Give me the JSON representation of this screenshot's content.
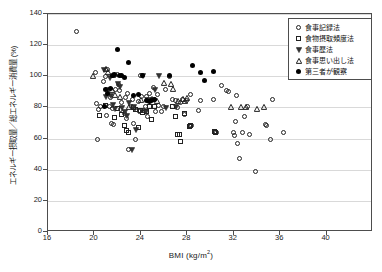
{
  "chart_data": {
    "type": "scatter",
    "title": "",
    "xlabel": "BMI (kg/m2)",
    "xlabel_base": "BMI (kg/m",
    "xlabel_sup": "2",
    "xlabel_close": ")",
    "ylabel": "エネルギー摂取量／総エネルギー消費量 (%)",
    "xlim": [
      16,
      44
    ],
    "ylim": [
      0,
      140
    ],
    "xticks": [
      16,
      20,
      24,
      28,
      32,
      36,
      40
    ],
    "yticks": [
      0,
      20,
      40,
      60,
      80,
      100,
      120,
      140
    ],
    "grid": "horizontal",
    "legend_position": "top-right",
    "series": [
      {
        "name": "食事記録法",
        "marker": "open-circle",
        "color": "#222222",
        "points": [
          [
            18.5,
            128.5
          ],
          [
            20.1,
            101.8
          ],
          [
            20.3,
            59.4
          ],
          [
            20.2,
            82.2
          ],
          [
            20.4,
            78.5
          ],
          [
            20.6,
            80.4
          ],
          [
            20.8,
            96.6
          ],
          [
            21.0,
            99.6
          ],
          [
            21.2,
            103.8
          ],
          [
            21.4,
            86.0
          ],
          [
            21.3,
            80.0
          ],
          [
            21.6,
            79.0
          ],
          [
            21.5,
            69.2
          ],
          [
            21.7,
            68.6
          ],
          [
            21.9,
            91.5
          ],
          [
            22.0,
            100.8
          ],
          [
            22.1,
            94.2
          ],
          [
            22.2,
            90.6
          ],
          [
            22.3,
            78.5
          ],
          [
            22.4,
            83.0
          ],
          [
            22.6,
            76.0
          ],
          [
            22.8,
            72.3
          ],
          [
            22.9,
            88.9
          ],
          [
            23.0,
            52.8
          ],
          [
            23.2,
            80.5
          ],
          [
            23.3,
            85.0
          ],
          [
            23.5,
            79.0
          ],
          [
            23.6,
            59.0
          ],
          [
            23.8,
            83.6
          ],
          [
            23.9,
            76.8
          ],
          [
            24.0,
            100.0
          ],
          [
            24.1,
            87.0
          ],
          [
            24.2,
            78.0
          ],
          [
            24.3,
            77.4
          ],
          [
            24.4,
            80.0
          ],
          [
            24.5,
            86.5
          ],
          [
            24.7,
            84.0
          ],
          [
            24.8,
            88.5
          ],
          [
            25.0,
            85.0
          ],
          [
            25.1,
            92.3
          ],
          [
            25.2,
            84.6
          ],
          [
            25.3,
            77.0
          ],
          [
            25.5,
            88.0
          ],
          [
            25.6,
            81.0
          ],
          [
            26.0,
            80.5
          ],
          [
            26.2,
            91.0
          ],
          [
            26.5,
            99.3
          ],
          [
            26.8,
            85.0
          ],
          [
            27.0,
            84.0
          ],
          [
            27.2,
            79.5
          ],
          [
            27.5,
            83.0
          ],
          [
            27.6,
            85.0
          ],
          [
            28.0,
            84.0
          ],
          [
            28.3,
            88.0
          ],
          [
            28.4,
            68.0
          ],
          [
            29.0,
            77.5
          ],
          [
            30.3,
            85.0
          ],
          [
            30.6,
            63.8
          ],
          [
            31.0,
            93.5
          ],
          [
            31.4,
            90.5
          ],
          [
            31.6,
            90.0
          ],
          [
            32.0,
            63.8
          ],
          [
            32.1,
            61.5
          ],
          [
            32.2,
            70.5
          ],
          [
            32.3,
            87.5
          ],
          [
            32.4,
            56.8
          ],
          [
            32.5,
            46.8
          ],
          [
            32.8,
            63.8
          ],
          [
            33.0,
            74.0
          ],
          [
            33.2,
            80.0
          ],
          [
            33.4,
            62.3
          ],
          [
            33.9,
            38.5
          ],
          [
            34.8,
            68.5
          ],
          [
            34.9,
            68.0
          ],
          [
            35.2,
            58.8
          ],
          [
            35.4,
            85.0
          ],
          [
            36.3,
            63.8
          ],
          [
            21.1,
            74.5
          ],
          [
            22.7,
            86.0
          ],
          [
            23.4,
            69.5
          ],
          [
            24.6,
            74.0
          ],
          [
            25.8,
            77.0
          ],
          [
            27.8,
            75.0
          ],
          [
            29.2,
            84.0
          ]
        ]
      },
      {
        "name": "食物摂取頻度法",
        "marker": "open-square",
        "color": "#222222",
        "points": [
          [
            20.5,
            74.8
          ],
          [
            21.0,
            81.0
          ],
          [
            21.8,
            73.5
          ],
          [
            22.0,
            79.0
          ],
          [
            22.4,
            75.0
          ],
          [
            22.6,
            68.0
          ],
          [
            22.8,
            65.0
          ],
          [
            23.0,
            63.8
          ],
          [
            23.4,
            79.5
          ],
          [
            23.6,
            78.5
          ],
          [
            24.0,
            78.0
          ],
          [
            24.2,
            76.5
          ],
          [
            24.5,
            77.0
          ],
          [
            25.0,
            72.0
          ],
          [
            25.2,
            80.0
          ],
          [
            27.0,
            74.0
          ],
          [
            27.2,
            62.5
          ],
          [
            27.4,
            62.5
          ],
          [
            27.5,
            57.8
          ],
          [
            27.8,
            76.0
          ],
          [
            28.2,
            67.5
          ],
          [
            28.3,
            68.0
          ],
          [
            30.4,
            64.0
          ],
          [
            30.5,
            63.5
          ],
          [
            23.8,
            66.5
          ],
          [
            24.8,
            80.5
          ],
          [
            26.8,
            80.0
          ]
        ]
      },
      {
        "name": "食事歴法",
        "marker": "triangle-down",
        "color": "#222222",
        "points": [
          [
            20.8,
            104.0
          ],
          [
            21.0,
            86.5
          ],
          [
            21.2,
            91.0
          ],
          [
            21.4,
            87.5
          ],
          [
            21.6,
            81.5
          ],
          [
            21.8,
            79.0
          ],
          [
            22.0,
            95.0
          ],
          [
            22.2,
            93.0
          ],
          [
            22.4,
            79.5
          ],
          [
            22.6,
            77.0
          ],
          [
            22.8,
            74.5
          ],
          [
            23.2,
            52.8
          ],
          [
            23.4,
            80.0
          ],
          [
            23.6,
            65.5
          ],
          [
            24.2,
            100.0
          ],
          [
            24.6,
            84.5
          ],
          [
            25.6,
            100.2
          ],
          [
            25.2,
            91.5
          ],
          [
            26.2,
            79.5
          ],
          [
            27.0,
            80.0
          ],
          [
            21.3,
            99.0
          ],
          [
            23.0,
            83.0
          ],
          [
            24.4,
            77.0
          ]
        ]
      },
      {
        "name": "食事思い出し法",
        "marker": "triangle-up",
        "color": "#222222",
        "points": [
          [
            19.9,
            100.0
          ],
          [
            21.0,
            105.0
          ],
          [
            21.2,
            102.5
          ],
          [
            21.5,
            91.0
          ],
          [
            21.8,
            88.0
          ],
          [
            22.2,
            86.5
          ],
          [
            23.0,
            80.0
          ],
          [
            24.0,
            85.0
          ],
          [
            25.0,
            85.5
          ],
          [
            26.0,
            96.0
          ],
          [
            26.6,
            95.0
          ],
          [
            26.8,
            92.0
          ],
          [
            27.2,
            84.0
          ],
          [
            27.6,
            85.5
          ],
          [
            27.8,
            84.0
          ],
          [
            28.0,
            86.0
          ],
          [
            31.8,
            80.5
          ],
          [
            32.6,
            80.5
          ],
          [
            33.1,
            80.5
          ],
          [
            34.0,
            79.0
          ],
          [
            34.6,
            80.5
          ],
          [
            21.6,
            101.0
          ],
          [
            25.4,
            84.0
          ]
        ]
      },
      {
        "name": "第三者が観察",
        "marker": "filled-circle",
        "color": "#000000",
        "points": [
          [
            22.0,
            117.0
          ],
          [
            23.0,
            108.5
          ],
          [
            21.6,
            100.5
          ],
          [
            21.8,
            100.8
          ],
          [
            22.2,
            100.0
          ],
          [
            22.4,
            100.5
          ],
          [
            22.6,
            99.0
          ],
          [
            24.2,
            100.0
          ],
          [
            26.5,
            100.0
          ],
          [
            28.5,
            106.5
          ],
          [
            29.2,
            102.3
          ],
          [
            29.5,
            97.0
          ],
          [
            30.3,
            103.0
          ],
          [
            21.4,
            92.0
          ],
          [
            21.0,
            91.0
          ],
          [
            23.8,
            88.0
          ],
          [
            24.5,
            84.0
          ],
          [
            24.8,
            83.5
          ],
          [
            25.0,
            84.0
          ],
          [
            25.2,
            84.5
          ],
          [
            21.2,
            88.5
          ],
          [
            20.9,
            80.5
          ],
          [
            23.4,
            87.5
          ]
        ]
      }
    ]
  },
  "legend": {
    "items": [
      {
        "label": "食事記録法",
        "marker": "open-circle"
      },
      {
        "label": "食物摂取頻度法",
        "marker": "open-square"
      },
      {
        "label": "食事歴法",
        "marker": "triangle-down"
      },
      {
        "label": "食事思い出し法",
        "marker": "triangle-up"
      },
      {
        "label": "第三者が観察",
        "marker": "filled-circle"
      }
    ]
  }
}
